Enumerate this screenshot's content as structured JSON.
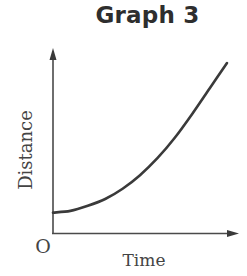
{
  "chart_data": {
    "type": "line",
    "title": "Graph 3",
    "xlabel": "Time",
    "ylabel": "Distance",
    "origin_label": "O",
    "grid": false,
    "legend": null,
    "axis_ticks": "none",
    "series": [
      {
        "name": "distance",
        "x": [
          0,
          0.1,
          0.2,
          0.3,
          0.4,
          0.5,
          0.6,
          0.7,
          0.8,
          0.9,
          1.0
        ],
        "y": [
          0.12,
          0.13,
          0.16,
          0.2,
          0.26,
          0.34,
          0.44,
          0.56,
          0.7,
          0.85,
          1.0
        ]
      }
    ],
    "xlim": [
      0,
      1.1
    ],
    "ylim": [
      0,
      1.1
    ],
    "colors": {
      "axis": "#4a4a4a",
      "curve": "#3a3a3a",
      "text": "#444444"
    }
  }
}
